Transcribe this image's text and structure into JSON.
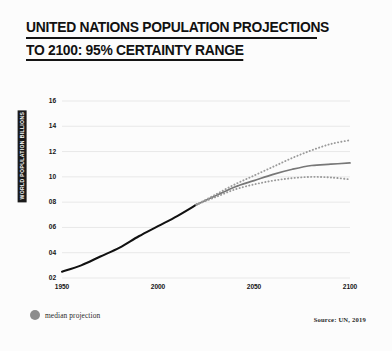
{
  "title": {
    "line1": "UNITED NATIONS POPULATION PROJECTIONS",
    "line2": "TO 2100: 95% CERTAINTY RANGE"
  },
  "legend": {
    "median_label": "median projection",
    "dot_color": "#8c8c8c"
  },
  "footer": {
    "source": "Source: UN, 2019"
  },
  "colors": {
    "historical_line": "#111111",
    "median_line": "#777777",
    "bound_line": "#9a9a9a",
    "grid": "#e8e8e8",
    "background": "#fcfcfc",
    "text": "#161616"
  },
  "chart_data": {
    "type": "line",
    "title": "UNITED NATIONS POPULATION PROJECTIONS TO 2100: 95% CERTAINTY RANGE",
    "xlabel": "",
    "ylabel": "WORLD POPULATION BILLIONS",
    "xlim": [
      1950,
      2100
    ],
    "ylim": [
      2,
      16
    ],
    "xticks": [
      1950,
      2000,
      2050,
      2100
    ],
    "xtick_labels": [
      "1950",
      "2000",
      "2050",
      "2100"
    ],
    "yticks": [
      2,
      4,
      6,
      8,
      10,
      12,
      14,
      16
    ],
    "ytick_labels": [
      "02",
      "04",
      "06",
      "08",
      "10",
      "12",
      "14",
      "16"
    ],
    "grid": true,
    "legend_position": "below-left",
    "annotations": [
      "Source: UN, 2019"
    ],
    "series": [
      {
        "name": "historical",
        "style": "solid",
        "color": "#111111",
        "x": [
          1950,
          1960,
          1970,
          1980,
          1990,
          2000,
          2010,
          2020
        ],
        "values": [
          2.5,
          3.0,
          3.7,
          4.4,
          5.3,
          6.1,
          6.9,
          7.8
        ]
      },
      {
        "name": "median projection",
        "style": "solid",
        "color": "#777777",
        "x": [
          2020,
          2030,
          2040,
          2050,
          2060,
          2070,
          2080,
          2090,
          2100
        ],
        "values": [
          7.8,
          8.5,
          9.2,
          9.7,
          10.2,
          10.6,
          10.9,
          11.0,
          11.1
        ]
      },
      {
        "name": "95% upper bound",
        "style": "dotted",
        "color": "#9a9a9a",
        "x": [
          2020,
          2030,
          2040,
          2050,
          2060,
          2070,
          2080,
          2090,
          2100
        ],
        "values": [
          7.8,
          8.6,
          9.4,
          10.1,
          10.8,
          11.5,
          12.1,
          12.6,
          12.9
        ]
      },
      {
        "name": "95% lower bound",
        "style": "dotted",
        "color": "#9a9a9a",
        "x": [
          2020,
          2030,
          2040,
          2050,
          2060,
          2070,
          2080,
          2090,
          2100
        ],
        "values": [
          7.8,
          8.4,
          9.0,
          9.4,
          9.7,
          9.9,
          10.0,
          9.95,
          9.8
        ]
      }
    ]
  }
}
